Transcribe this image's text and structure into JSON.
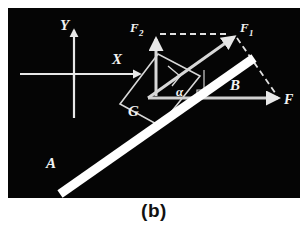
{
  "figure": {
    "caption": "(b)",
    "panel_background": "#050505",
    "page_background": "#ffffff",
    "stroke_color": "#e8e8e8",
    "rod_color": "#ffffff"
  },
  "axes": {
    "y_label": "Y",
    "x_label": "X",
    "origin": {
      "x": 66,
      "y": 66
    },
    "y_tip": {
      "x": 66,
      "y": 22
    },
    "x_tip": {
      "x": 132,
      "y": 66
    }
  },
  "rod": {
    "end_lower_label": "A",
    "end_upper_label": "B",
    "start": {
      "x": 52,
      "y": 186
    },
    "end": {
      "x": 244,
      "y": 52
    },
    "thickness": 9
  },
  "angle": {
    "symbol": "α",
    "name": "alpha",
    "position": {
      "x": 172,
      "y": 84
    }
  },
  "vectors": [
    {
      "name": "F",
      "label": "F",
      "description": "resultant horizontal force",
      "from": {
        "x": 140,
        "y": 90
      },
      "to": {
        "x": 272,
        "y": 90
      },
      "style": "solid",
      "label_pos": {
        "x": 282,
        "y": 94
      }
    },
    {
      "name": "F1",
      "label": "F",
      "subscript": "1",
      "description": "component along the rod",
      "from": {
        "x": 140,
        "y": 90
      },
      "to": {
        "x": 226,
        "y": 28
      },
      "style": "solid",
      "label_pos": {
        "x": 234,
        "y": 24
      }
    },
    {
      "name": "F2",
      "label": "F",
      "subscript": "2",
      "description": "component perpendicular to the rod",
      "from": {
        "x": 148,
        "y": 88
      },
      "to": {
        "x": 148,
        "y": 32
      },
      "style": "solid",
      "label_pos": {
        "x": 128,
        "y": 24
      }
    }
  ],
  "construction": {
    "parallelogram_label": "G",
    "parallelogram_label_pos": {
      "x": 126,
      "y": 106
    },
    "parallelogram_points": "112,96 150,46 192,68 152,118",
    "dashed_top": {
      "from": {
        "x": 152,
        "y": 26
      },
      "to": {
        "x": 220,
        "y": 26
      }
    },
    "dashed_diagonal": {
      "from": {
        "x": 228,
        "y": 30
      },
      "to": {
        "x": 268,
        "y": 88
      }
    },
    "perpendicular_drop": {
      "from": {
        "x": 196,
        "y": 90
      },
      "to": {
        "x": 196,
        "y": 66
      }
    },
    "right_angle_marks": 2
  },
  "labels": {
    "A": "A",
    "B": "B",
    "G": "G",
    "X": "X",
    "Y": "Y",
    "F": "F",
    "F1_base": "F",
    "F1_sub": "1",
    "F2_base": "F",
    "F2_sub": "2",
    "alpha": "α"
  },
  "label_positions": {
    "A": {
      "x": 48,
      "y": 160
    },
    "B": {
      "x": 228,
      "y": 80
    }
  }
}
